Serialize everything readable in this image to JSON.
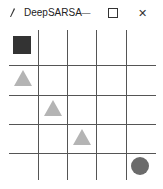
{
  "window": {
    "title": "DeepSARSA",
    "controls": {
      "minimize": "—",
      "maximize": "☐",
      "close": "✕"
    }
  },
  "grid": {
    "rows": 5,
    "cols": 5,
    "line_color": "#555555",
    "objects": [
      {
        "type": "agent-square",
        "row": 0,
        "col": 0,
        "color": "#333333"
      },
      {
        "type": "triangle",
        "row": 1,
        "col": 0,
        "color": "#b4b4b4"
      },
      {
        "type": "triangle",
        "row": 2,
        "col": 1,
        "color": "#b4b4b4"
      },
      {
        "type": "triangle",
        "row": 3,
        "col": 2,
        "color": "#b4b4b4"
      },
      {
        "type": "circle",
        "row": 4,
        "col": 4,
        "color": "#6b6b6b"
      }
    ]
  }
}
